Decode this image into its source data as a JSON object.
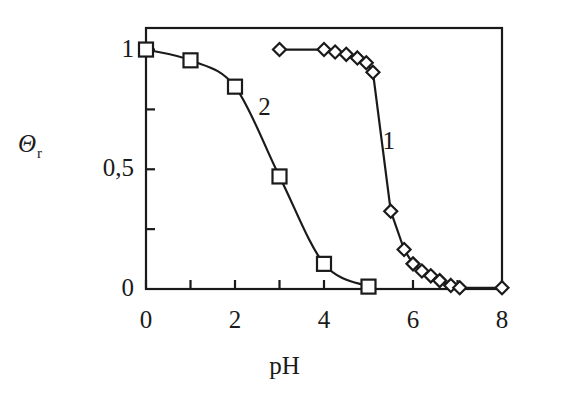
{
  "figure": {
    "background": "#ffffff",
    "ink_color": "#1a1a1a",
    "frame": {
      "left": 146,
      "right": 502,
      "top": 28,
      "bottom": 289
    }
  },
  "axes": {
    "y": {
      "title": "Θ",
      "title_subscript": "r",
      "tick_labels": [
        "1",
        "0,5",
        "0"
      ],
      "tick_values": [
        1,
        0.5,
        0
      ],
      "minor_tick_values": [
        0.75,
        0.25
      ]
    },
    "x": {
      "title": "pH",
      "tick_labels": [
        "0",
        "2",
        "4",
        "6",
        "8"
      ],
      "tick_values": [
        0,
        2,
        4,
        6,
        8
      ],
      "minor_tick_values": [
        1,
        3,
        5,
        7
      ]
    }
  },
  "series_labels": {
    "one": "1",
    "two": "2"
  },
  "chart_data": {
    "type": "line",
    "title": "",
    "subtitle": "",
    "xlabel": "pH",
    "ylabel": "Θr",
    "xlim": [
      0,
      8
    ],
    "ylim": [
      0,
      1.09
    ],
    "grid": false,
    "legend": "inline-curve-labels",
    "ytick_labels": [
      "0",
      "0,5",
      "1"
    ],
    "ytick_values": [
      0,
      0.5,
      1
    ],
    "xtick_values": [
      0,
      2,
      4,
      6,
      8
    ],
    "series": [
      {
        "name": "1",
        "marker": "diamond-open",
        "label_position": {
          "x": 5.45,
          "y": 0.62
        },
        "points": [
          {
            "x": 3.0,
            "y": 1.0
          },
          {
            "x": 4.0,
            "y": 1.0
          },
          {
            "x": 4.25,
            "y": 0.99
          },
          {
            "x": 4.5,
            "y": 0.98
          },
          {
            "x": 4.75,
            "y": 0.965
          },
          {
            "x": 4.95,
            "y": 0.945
          },
          {
            "x": 5.1,
            "y": 0.905
          },
          {
            "x": 5.5,
            "y": 0.325
          },
          {
            "x": 5.8,
            "y": 0.165
          },
          {
            "x": 6.0,
            "y": 0.105
          },
          {
            "x": 6.2,
            "y": 0.075
          },
          {
            "x": 6.4,
            "y": 0.055
          },
          {
            "x": 6.6,
            "y": 0.035
          },
          {
            "x": 6.85,
            "y": 0.015
          },
          {
            "x": 7.05,
            "y": 0.005
          },
          {
            "x": 8.0,
            "y": 0.005
          }
        ]
      },
      {
        "name": "2",
        "marker": "square-open",
        "label_position": {
          "x": 2.7,
          "y": 0.76
        },
        "points": [
          {
            "x": 0.0,
            "y": 1.0
          },
          {
            "x": 1.0,
            "y": 0.955
          },
          {
            "x": 2.0,
            "y": 0.845
          },
          {
            "x": 3.0,
            "y": 0.47
          },
          {
            "x": 4.0,
            "y": 0.105
          },
          {
            "x": 5.0,
            "y": 0.01
          }
        ]
      }
    ]
  }
}
